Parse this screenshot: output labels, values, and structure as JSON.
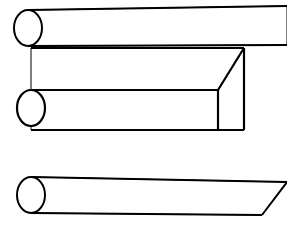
{
  "figure": {
    "background_color": "#ffffff",
    "stroke_color": "#000000",
    "canvas": {
      "width": 287,
      "height": 227
    },
    "shape_count": 3
  },
  "shapes": [
    {
      "id": "top-bar",
      "name": "Cylinder with square end, running off right edge",
      "end_cap": "ellipse",
      "stroke_width": 2.0,
      "ellipse": {
        "cx": 28,
        "cy": 28,
        "rx": 14,
        "ry": 18
      },
      "top_edge": {
        "x1": 28,
        "y1": 10,
        "x2": 287,
        "y2": 6
      },
      "bottom_edge": {
        "x1": 28,
        "y1": 46,
        "x2": 287,
        "y2": 45
      },
      "right_end": "open"
    },
    {
      "id": "middle-bar",
      "name": "Cylinder with chamfered wedge end",
      "end_cap": "ellipse",
      "stroke_width": 2.2,
      "ellipse": {
        "cx": 31,
        "cy": 108,
        "rx": 14,
        "ry": 18
      },
      "top_edge": {
        "x1": 31,
        "y1": 48,
        "x2": 244,
        "y2": 48
      },
      "bottom_edge": {
        "x1": 31,
        "y1": 130,
        "x2": 244,
        "y2": 130
      },
      "seam_edge": {
        "x1": 31,
        "y1": 90,
        "x2": 218,
        "y2": 90
      },
      "vertical_edge": {
        "x1": 218,
        "y1": 90,
        "x2": 218,
        "y2": 130
      },
      "chamfer_edge": {
        "x1": 218,
        "y1": 90,
        "x2": 244,
        "y2": 48
      },
      "right_edge": {
        "x1": 244,
        "y1": 48,
        "x2": 244,
        "y2": 130
      },
      "right_end": "chamfered"
    },
    {
      "id": "bottom-bar",
      "name": "Cylinder with oblique angled cut end",
      "end_cap": "ellipse",
      "stroke_width": 2.0,
      "ellipse": {
        "cx": 31,
        "cy": 195,
        "rx": 14,
        "ry": 18
      },
      "top_edge": {
        "x1": 31,
        "y1": 177,
        "x2": 287,
        "y2": 182
      },
      "bottom_edge": {
        "x1": 31,
        "y1": 213,
        "x2": 262,
        "y2": 215
      },
      "angled_cut": {
        "x1": 262,
        "y1": 215,
        "x2": 287,
        "y2": 182
      },
      "right_end": "oblique-cut"
    }
  ],
  "labels": {
    "alt_text": "Black and white technical line drawing showing three long cylindrical bars in perspective; the top bar extends past the right edge, the middle bar terminates in a chamfered wedge face, and the bottom bar terminates in a single oblique angled cut."
  }
}
